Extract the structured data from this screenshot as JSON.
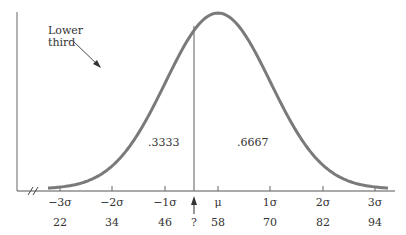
{
  "figure": {
    "type": "normal-distribution-diagram",
    "annotation": {
      "line1": "Lower",
      "line2": "third"
    },
    "regions": {
      "left_area": ".3333",
      "right_area": ".6667"
    },
    "axis_break": "//",
    "sigma_labels": [
      "−3σ",
      "−2σ",
      "−1σ",
      "μ",
      "1σ",
      "2σ",
      "3σ"
    ],
    "score_labels": [
      "22",
      "34",
      "46",
      "58",
      "70",
      "82",
      "94"
    ],
    "unknown_marker": "?",
    "colors": {
      "curve": "#777777",
      "axis": "#555555",
      "text": "#333333"
    }
  }
}
